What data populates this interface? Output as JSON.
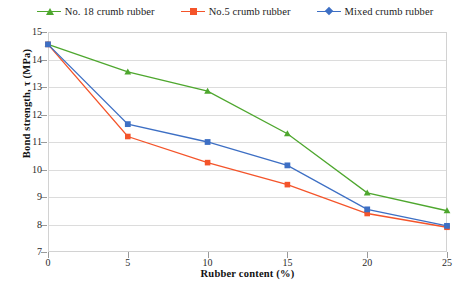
{
  "chart_data": {
    "type": "line",
    "title": "",
    "xlabel": "Rubber content (%)",
    "ylabel": "Bond strength, τ (MPa)",
    "x": [
      0,
      5,
      10,
      15,
      20,
      25
    ],
    "xlim": [
      0,
      25
    ],
    "ylim": [
      7,
      15
    ],
    "xticks": [
      "0",
      "5",
      "10",
      "15",
      "20",
      "25"
    ],
    "yticks": [
      "7",
      "8",
      "9",
      "10",
      "11",
      "12",
      "13",
      "14",
      "15"
    ],
    "grid": "horizontal",
    "legend_position": "top-center",
    "series": [
      {
        "name": "No. 18 crumb rubber",
        "color": "#4ea72e",
        "marker": "triangle",
        "values": [
          14.55,
          13.55,
          12.85,
          11.3,
          9.15,
          8.5
        ]
      },
      {
        "name": "No.5 crumb rubber",
        "color": "#f4542a",
        "marker": "square",
        "values": [
          14.55,
          11.2,
          10.25,
          9.45,
          8.4,
          7.9
        ]
      },
      {
        "name": "Mixed crumb rubber",
        "color": "#3d6fc4",
        "marker": "diamond",
        "values": [
          14.55,
          11.65,
          11.0,
          10.15,
          8.55,
          7.95
        ]
      }
    ]
  },
  "legend": {
    "items": [
      {
        "label": "No. 18 crumb rubber",
        "color": "#4ea72e"
      },
      {
        "label": "No.5 crumb rubber",
        "color": "#f4542a"
      },
      {
        "label": "Mixed crumb rubber",
        "color": "#3d6fc4"
      }
    ]
  },
  "axes": {
    "x_title": "Rubber content (%)",
    "y_title": "Bond strength, τ (MPa)"
  }
}
